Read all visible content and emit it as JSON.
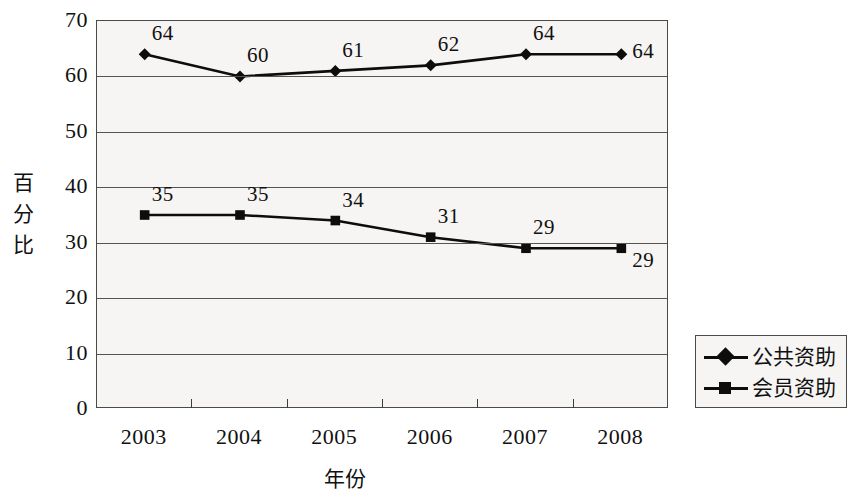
{
  "chart_data": {
    "type": "line",
    "title": "",
    "xlabel": "年份",
    "ylabel": "百分比",
    "categories": [
      "2003",
      "2004",
      "2005",
      "2006",
      "2007",
      "2008"
    ],
    "ylim": [
      0,
      70
    ],
    "y_ticks": [
      "70",
      "60",
      "50",
      "40",
      "30",
      "20",
      "10",
      "0"
    ],
    "grid": "horizontal",
    "legend_position": "right",
    "series": [
      {
        "name": "公共资助",
        "marker": "diamond",
        "color": "#0d0d0d",
        "values": [
          64,
          60,
          61,
          62,
          64,
          64
        ],
        "labels": [
          "64",
          "60",
          "61",
          "62",
          "64",
          "64"
        ]
      },
      {
        "name": "会员资助",
        "marker": "square",
        "color": "#0d0d0d",
        "values": [
          35,
          35,
          34,
          31,
          29,
          29
        ],
        "labels": [
          "35",
          "35",
          "34",
          "31",
          "29",
          "29"
        ]
      }
    ]
  },
  "axis": {
    "y_title_chars": [
      "百",
      "分",
      "比"
    ]
  }
}
